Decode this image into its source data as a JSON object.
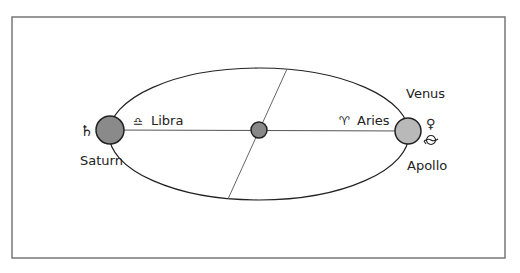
{
  "diagram": {
    "frame": {
      "x": 12,
      "y": 17,
      "width": 493,
      "height": 241
    },
    "orbit": {
      "cx": 259,
      "cy": 134,
      "rx": 150,
      "ry": 66
    },
    "center_body": {
      "cx": 259,
      "cy": 130,
      "r": 8,
      "fill": "#888888"
    },
    "left_body": {
      "name": "Saturn",
      "symbol": "♄",
      "cx": 110,
      "cy": 130,
      "r": 14,
      "fill": "#8a8a8a"
    },
    "right_body": {
      "name_top": "Venus",
      "name_bottom": "Apollo",
      "symbol_top": "♀",
      "symbol_bottom": "⯞",
      "cx": 408,
      "cy": 131,
      "r": 13,
      "fill": "#b9b9b9"
    },
    "labels": {
      "libra": "Libra",
      "libra_symbol": "♎",
      "aries": "Aries",
      "aries_symbol": "♈",
      "saturn": "Saturn",
      "venus": "Venus",
      "apollo": "Apollo"
    },
    "axis_line_color": "#555555",
    "stroke_color": "#222222"
  }
}
